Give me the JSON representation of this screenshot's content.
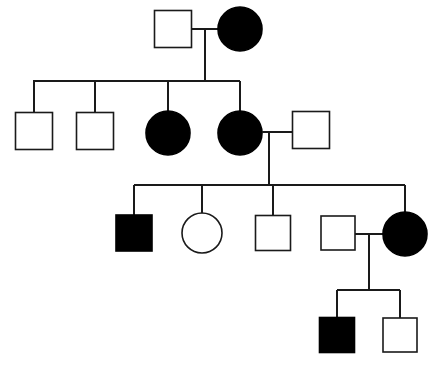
{
  "figure": {
    "type": "pedigree-chart",
    "title": "Family pedigree chart",
    "width": 434,
    "height": 366,
    "background_color": "#ffffff",
    "line_color": "#1a1a1a",
    "affected_fill_color": "#000000",
    "unaffected_fill_color": "#ffffff"
  },
  "legend": {
    "square_meaning": "male",
    "circle_meaning": "female",
    "filled_meaning": "affected",
    "open_meaning": "unaffected"
  },
  "chart_data": {
    "type": "diagram",
    "title": "Family pedigree chart",
    "generations": [
      {
        "label": "I",
        "individuals": [
          {
            "id": "I-1",
            "shape": "square",
            "sex": "male",
            "status": "unaffected",
            "filled": false,
            "x": 173,
            "y": 29,
            "size": 37
          },
          {
            "id": "I-2",
            "shape": "circle",
            "sex": "female",
            "status": "affected",
            "filled": true,
            "x": 240,
            "y": 29,
            "size": 44
          }
        ]
      },
      {
        "label": "II",
        "individuals": [
          {
            "id": "II-1",
            "shape": "square",
            "sex": "male",
            "status": "unaffected",
            "filled": false,
            "x": 34,
            "y": 131,
            "size": 37
          },
          {
            "id": "II-2",
            "shape": "square",
            "sex": "male",
            "status": "unaffected",
            "filled": false,
            "x": 95,
            "y": 131,
            "size": 37
          },
          {
            "id": "II-3",
            "shape": "circle",
            "sex": "female",
            "status": "affected",
            "filled": true,
            "x": 168,
            "y": 133,
            "size": 44
          },
          {
            "id": "II-4",
            "shape": "circle",
            "sex": "female",
            "status": "affected",
            "filled": true,
            "x": 240,
            "y": 133,
            "size": 44
          },
          {
            "id": "II-5",
            "shape": "square",
            "sex": "male",
            "status": "unaffected",
            "filled": false,
            "x": 311,
            "y": 130,
            "size": 37
          }
        ]
      },
      {
        "label": "III",
        "individuals": [
          {
            "id": "III-1",
            "shape": "square",
            "sex": "male",
            "status": "affected",
            "filled": true,
            "x": 134,
            "y": 233,
            "size": 36
          },
          {
            "id": "III-2",
            "shape": "circle",
            "sex": "female",
            "status": "unaffected",
            "filled": false,
            "x": 202,
            "y": 233,
            "size": 40
          },
          {
            "id": "III-3",
            "shape": "square",
            "sex": "male",
            "status": "unaffected",
            "filled": false,
            "x": 273,
            "y": 233,
            "size": 35
          },
          {
            "id": "III-4",
            "shape": "square",
            "sex": "male",
            "status": "unaffected",
            "filled": false,
            "x": 338,
            "y": 233,
            "size": 34
          },
          {
            "id": "III-5",
            "shape": "circle",
            "sex": "female",
            "status": "affected",
            "filled": true,
            "x": 405,
            "y": 234,
            "size": 44
          }
        ]
      },
      {
        "label": "IV",
        "individuals": [
          {
            "id": "IV-1",
            "shape": "square",
            "sex": "male",
            "status": "affected",
            "filled": true,
            "x": 337,
            "y": 335,
            "size": 35
          },
          {
            "id": "IV-2",
            "shape": "square",
            "sex": "male",
            "status": "unaffected",
            "filled": false,
            "x": 400,
            "y": 335,
            "size": 34
          }
        ]
      }
    ],
    "matings": [
      {
        "id": "mating-1",
        "partners": [
          "I-1",
          "I-2"
        ],
        "line_y": 29,
        "descent_x": 205,
        "children": [
          "II-1",
          "II-2",
          "II-3",
          "II-4"
        ],
        "sibship_line_y": 81
      },
      {
        "id": "mating-2",
        "partners": [
          "II-4",
          "II-5"
        ],
        "line_y": 132,
        "descent_x": 269,
        "children": [
          "III-1",
          "III-2",
          "III-3",
          "III-5"
        ],
        "sibship_line_y": 185
      },
      {
        "id": "mating-3",
        "partners": [
          "III-4",
          "III-5"
        ],
        "line_y": 234,
        "descent_x": 369,
        "children": [
          "IV-1",
          "IV-2"
        ],
        "sibship_line_y": 290
      }
    ],
    "counts": {
      "total_individuals": 14,
      "affected_individuals": 6,
      "unaffected_individuals": 8,
      "males": 9,
      "females": 5,
      "generations": 4
    }
  }
}
